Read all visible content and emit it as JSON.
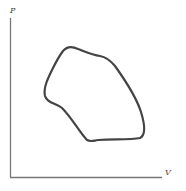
{
  "diagram": {
    "type": "PV diagram",
    "axes": {
      "y_label": "P",
      "x_label": "V"
    },
    "curve": {
      "description": "closed cycle loop",
      "stroke_color": "#444444"
    },
    "axis_color": "#555555"
  }
}
